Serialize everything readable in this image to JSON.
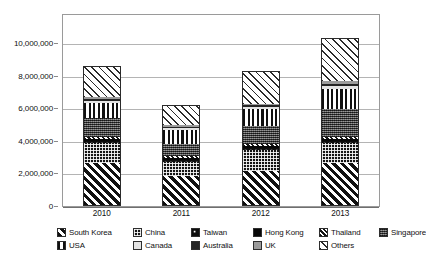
{
  "chart_data": {
    "type": "bar",
    "subtype": "stacked-bar",
    "title": "",
    "xlabel": "",
    "ylabel": "",
    "categories": [
      "2010",
      "2011",
      "2012",
      "2013"
    ],
    "ylim": [
      0,
      10000000
    ],
    "ytick_values": [
      0,
      2000000,
      4000000,
      6000000,
      8000000,
      10000000
    ],
    "ytick_labels": [
      "0",
      "2,000,000",
      "4,000,000",
      "6,000,000",
      "8,000,000",
      "10,000,000"
    ],
    "grid": true,
    "grid_axis": "y",
    "legend_position": "bottom",
    "legend_ncol": 6,
    "totals": [
      8600000,
      6200000,
      8300000,
      10300000
    ],
    "series": [
      {
        "name": "South Korea",
        "pattern": "diagonal-stripes-thick",
        "values": [
          2550000,
          1760000,
          2100000,
          2600000
        ]
      },
      {
        "name": "China",
        "pattern": "dense-checker-dark",
        "values": [
          1250000,
          900000,
          1270000,
          1180000
        ]
      },
      {
        "name": "Taiwan",
        "pattern": "black-with-white-dots",
        "values": [
          150000,
          120000,
          130000,
          140000
        ]
      },
      {
        "name": "Hong Kong",
        "pattern": "solid-black",
        "values": [
          130000,
          110000,
          120000,
          130000
        ]
      },
      {
        "name": "Thailand",
        "pattern": "diagonal-stripes-fine",
        "values": [
          100000,
          90000,
          110000,
          120000
        ]
      },
      {
        "name": "Singapore",
        "pattern": "gray-speckle",
        "values": [
          1170000,
          740000,
          1120000,
          1720000
        ]
      },
      {
        "name": "USA",
        "pattern": "vertical-bars",
        "values": [
          930000,
          880000,
          1030000,
          1240000
        ]
      },
      {
        "name": "Canada",
        "pattern": "very-light-gray",
        "values": [
          120000,
          100000,
          110000,
          150000
        ]
      },
      {
        "name": "Australia",
        "pattern": "solid-dark",
        "values": [
          130000,
          110000,
          120000,
          170000
        ]
      },
      {
        "name": "UK",
        "pattern": "medium-gray",
        "values": [
          120000,
          100000,
          110000,
          140000
        ]
      },
      {
        "name": "Others",
        "pattern": "white-diagonal-hatch",
        "values": [
          1950000,
          1290000,
          2080000,
          2710000
        ]
      }
    ]
  },
  "legend": {
    "rows": [
      [
        {
          "label": "South Korea",
          "pattern_class": "p-southkorea"
        },
        {
          "label": "China",
          "pattern_class": "p-china"
        },
        {
          "label": "Taiwan",
          "pattern_class": "p-taiwan"
        },
        {
          "label": "Hong Kong",
          "pattern_class": "p-hongkong"
        },
        {
          "label": "Thailand",
          "pattern_class": "p-thailand"
        },
        {
          "label": "Singapore",
          "pattern_class": "p-singapore"
        }
      ],
      [
        {
          "label": "USA",
          "pattern_class": "p-usa"
        },
        {
          "label": "Canada",
          "pattern_class": "p-canada"
        },
        {
          "label": "Australia",
          "pattern_class": "p-australia"
        },
        {
          "label": "UK",
          "pattern_class": "p-uk"
        },
        {
          "label": "Others",
          "pattern_class": "p-others"
        }
      ]
    ]
  },
  "colors": {
    "frame": "#9a9a9a",
    "gridline": "#b4b4b4",
    "text": "#111111",
    "background": "#ffffff"
  }
}
